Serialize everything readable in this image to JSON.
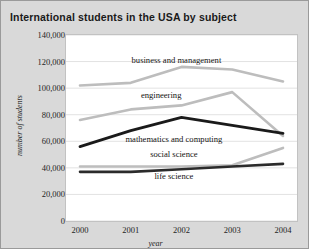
{
  "chart_data": {
    "type": "line",
    "title": "International students in the USA by subject",
    "xlabel": "year",
    "ylabel": "number of students",
    "categories": [
      "2000",
      "2001",
      "2002",
      "2003",
      "2004"
    ],
    "x": [
      2000,
      2001,
      2002,
      2003,
      2004
    ],
    "ylim": [
      0,
      140000
    ],
    "xlim": [
      2000,
      2004
    ],
    "yticks": [
      "0",
      "20,000",
      "40,000",
      "60,000",
      "80,000",
      "100,000",
      "120,000",
      "140,000"
    ],
    "ytick_values": [
      0,
      20000,
      40000,
      60000,
      80000,
      100000,
      120000,
      140000
    ],
    "grid": "horizontal",
    "legend": "inline-labels",
    "series": [
      {
        "name": "business and management",
        "values": [
          102000,
          104000,
          116000,
          114000,
          105000
        ],
        "color": "#bdbdbd",
        "width": 2.6,
        "label_x": 2001.9,
        "label_y": 121000
      },
      {
        "name": "engineering",
        "values": [
          76000,
          84000,
          87000,
          97000,
          64000
        ],
        "color": "#bdbdbd",
        "width": 2.6,
        "label_x": 2001.6,
        "label_y": 95000
      },
      {
        "name": "mathematics and computing",
        "values": [
          56000,
          68000,
          78000,
          72000,
          66000
        ],
        "color": "#1a1a1a",
        "width": 2.8,
        "label_x": 2001.85,
        "label_y": 62000
      },
      {
        "name": "social science",
        "values": [
          41000,
          41000,
          41000,
          42000,
          55000
        ],
        "color": "#bdbdbd",
        "width": 2.6,
        "label_x": 2001.85,
        "label_y": 50500
      },
      {
        "name": "life science",
        "values": [
          37000,
          37000,
          39000,
          41000,
          43000
        ],
        "color": "#2b2b2b",
        "width": 2.6,
        "label_x": 2001.85,
        "label_y": 33500
      }
    ],
    "colors": {
      "figure_background": "#d9d9d9",
      "plot_background": "#ffffff",
      "grid": "#e2e2e2",
      "text": "#1f1f1f",
      "title": "#1a1a1a"
    }
  }
}
